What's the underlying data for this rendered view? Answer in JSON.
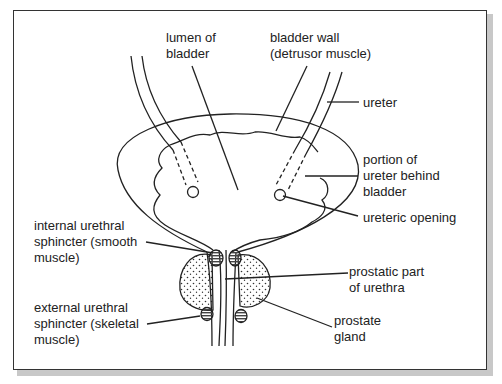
{
  "diagram": {
    "labels": {
      "lumen": "lumen of\nbladder",
      "bladder_wall": "bladder wall\n(detrusor muscle)",
      "ureter": "ureter",
      "ureter_behind": "portion of\nureter behind\nbladder",
      "ureteric_opening": "ureteric opening",
      "internal_sphincter": "internal urethral\nsphincter (smooth\nmuscle)",
      "prostatic_urethra": "prostatic part\nof urethra",
      "external_sphincter": "external urethral\nsphincter (skeletal\nmuscle)",
      "prostate": "prostate\ngland"
    },
    "colors": {
      "line": "#222222",
      "frame": "#333333",
      "shadow": "#c8c8c8",
      "background": "#ffffff"
    }
  }
}
